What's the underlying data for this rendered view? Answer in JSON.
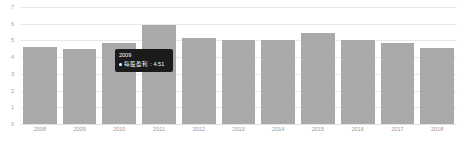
{
  "chart_data": {
    "type": "bar",
    "title": "",
    "subtitle": "",
    "xlabel": "",
    "ylabel": "",
    "grid": true,
    "legend_position": "none",
    "ylim": [
      0,
      7
    ],
    "yticks": [
      0,
      1,
      2,
      3,
      4,
      5,
      6,
      7
    ],
    "ytick_labels": [
      "0",
      "1",
      "2",
      "3",
      "4",
      "5",
      "6",
      "7"
    ],
    "categories": [
      "2008",
      "2009",
      "2010",
      "2011",
      "2012",
      "2013",
      "2014",
      "2015",
      "2016",
      "2017",
      "2018"
    ],
    "series": [
      {
        "name": "每股盈利",
        "color": "#a9a9ac",
        "values": [
          4.62,
          4.51,
          4.87,
          5.95,
          5.17,
          5.01,
          5.02,
          5.44,
          5.0,
          4.85,
          4.55
        ]
      }
    ]
  },
  "tooltip": {
    "visible": true,
    "title": "2009",
    "marker_color": "#ffffff",
    "series_label": "每股盈利",
    "separator": ": ",
    "value": "4.51"
  },
  "axis": {
    "bar_color": "#a9a9ac",
    "gridline_color": "#e9e9ec",
    "tick_text_color": "#a0a0a6"
  }
}
